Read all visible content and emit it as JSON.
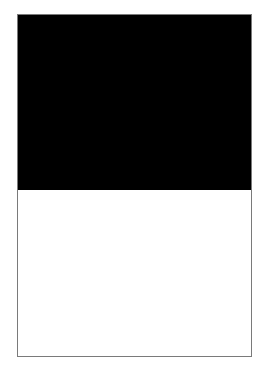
{
  "figure": {
    "top_panel": {
      "color": "#000000"
    },
    "bottom_panel": {
      "color": "#ffffff"
    },
    "border_color": "#7a7a7a"
  }
}
